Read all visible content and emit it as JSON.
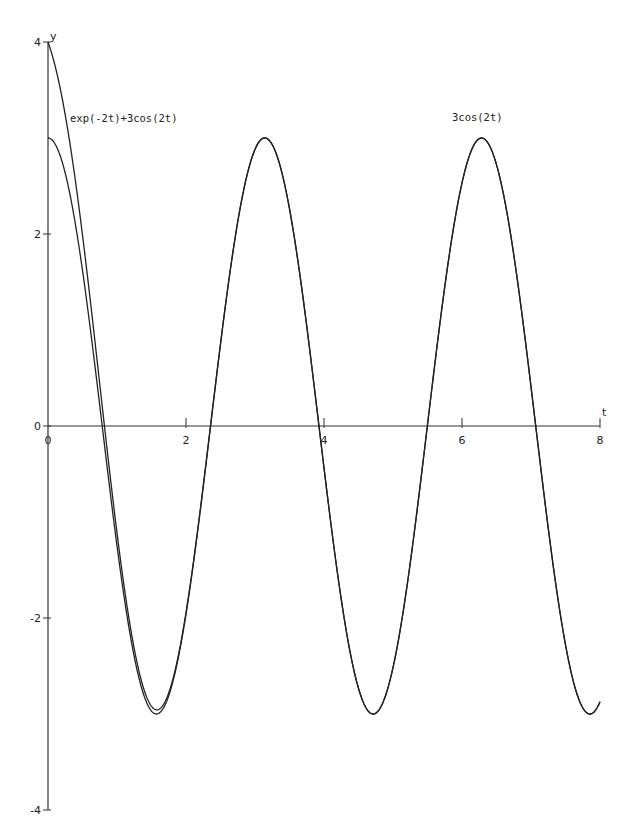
{
  "chart_data": {
    "type": "line",
    "title": "",
    "xlabel": "t",
    "ylabel": "y",
    "xlim": [
      0,
      8
    ],
    "ylim": [
      -4,
      4
    ],
    "grid": false,
    "legend_position": "none",
    "x_ticks": [
      0,
      2,
      4,
      6,
      8
    ],
    "x_tick_labels": [
      "0",
      "2",
      "4",
      "6",
      "8"
    ],
    "y_ticks": [
      -4,
      -2,
      0,
      2,
      4
    ],
    "y_tick_labels": [
      "-4",
      "-2",
      "0",
      "2",
      "4"
    ],
    "series": [
      {
        "name": "exp(-2t)+3cos(2t)",
        "expression": "exp(-2*t)+3*cos(2*t)",
        "x_range": [
          0,
          8
        ],
        "samples": [
          [
            0,
            4.0
          ],
          [
            0.5,
            1.99
          ],
          [
            1,
            -1.11
          ],
          [
            1.5,
            -2.92
          ],
          [
            2,
            -1.94
          ],
          [
            3,
            2.88
          ],
          [
            4,
            -0.44
          ],
          [
            5,
            -2.52
          ],
          [
            6,
            2.53
          ],
          [
            7,
            0.41
          ],
          [
            8,
            -2.88
          ]
        ]
      },
      {
        "name": "3cos(2t)",
        "expression": "3*cos(2*t)",
        "x_range": [
          0,
          8
        ],
        "samples": [
          [
            0,
            3.0
          ],
          [
            0.5,
            1.62
          ],
          [
            1,
            -1.25
          ],
          [
            1.5,
            -2.97
          ],
          [
            2,
            -1.96
          ],
          [
            3,
            2.88
          ],
          [
            4,
            -0.44
          ],
          [
            5,
            -2.52
          ],
          [
            6,
            2.53
          ],
          [
            7,
            0.41
          ],
          [
            8,
            -2.88
          ]
        ]
      }
    ],
    "annotations": [
      {
        "text": "exp(-2t)+3cos(2t)",
        "near": "series 1 start"
      },
      {
        "text": "3cos(2t)",
        "near": "peak at t≈6.28"
      }
    ]
  }
}
